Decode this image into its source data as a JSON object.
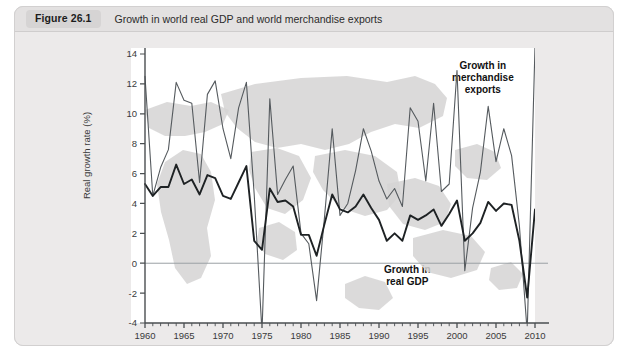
{
  "figure": {
    "badge": "Figure 26.1",
    "title": "Growth in world real GDP and world merchandise exports"
  },
  "colors": {
    "panel": "#ffffff",
    "card": "#eceaea",
    "caption_bar": "#e3e1e1",
    "badge": "#d6d4d4",
    "map": "#d5d4d3",
    "exports_line": "#555a5e",
    "gdp_line": "#1e2224",
    "zero_line": "#9aa0a4",
    "axis": "#4a4e51"
  },
  "annotations": {
    "exports": "Growth in\nmerchandise\nexports",
    "exports_lines": [
      "Growth in",
      "merchandise",
      "exports"
    ],
    "gdp": "Growth in\nreal GDP",
    "gdp_lines": [
      "Growth in",
      "real GDP"
    ]
  },
  "chart_data": {
    "type": "line",
    "title": "Growth in world real GDP and world merchandise exports",
    "xlabel": "",
    "ylabel": "Real growth rate (%)",
    "xlim": [
      1960,
      2010
    ],
    "ylim": [
      -4,
      14
    ],
    "ytick_step": 2,
    "yticks": [
      -4,
      -2,
      0,
      2,
      4,
      6,
      8,
      10,
      12,
      14
    ],
    "ytick_labels": [
      "-4",
      "-2",
      "0",
      "2",
      "4",
      "6",
      "8",
      "10",
      "12",
      "14"
    ],
    "xticks_major": [
      1960,
      1965,
      1970,
      1975,
      1980,
      1985,
      1990,
      1995,
      2000,
      2005,
      2010
    ],
    "xtick_labels": [
      "1960",
      "1965",
      "1970",
      "1975",
      "1980",
      "1985",
      "1990",
      "1995",
      "2000",
      "2005",
      "2010"
    ],
    "xticks_minor_step": 1,
    "grid": false,
    "zero_line": 0,
    "legend_position": "inline-annotation",
    "x": [
      1960,
      1961,
      1962,
      1963,
      1964,
      1965,
      1966,
      1967,
      1968,
      1969,
      1970,
      1971,
      1972,
      1973,
      1974,
      1975,
      1976,
      1977,
      1978,
      1979,
      1980,
      1981,
      1982,
      1983,
      1984,
      1985,
      1986,
      1987,
      1988,
      1989,
      1990,
      1991,
      1992,
      1993,
      1994,
      1995,
      1996,
      1997,
      1998,
      1999,
      2000,
      2001,
      2002,
      2003,
      2004,
      2005,
      2006,
      2007,
      2008,
      2009,
      2010
    ],
    "series": [
      {
        "name": "Growth in merchandise exports",
        "style": "thin",
        "values": [
          12.5,
          4.5,
          6.4,
          7.6,
          12.1,
          10.9,
          10.7,
          5.4,
          11.3,
          12.2,
          9.0,
          7.0,
          10.4,
          12.1,
          4.6,
          -7.0,
          11.0,
          4.6,
          5.6,
          6.5,
          2.0,
          1.3,
          -2.5,
          3.0,
          9.0,
          3.2,
          4.0,
          6.2,
          9.0,
          7.5,
          5.5,
          4.3,
          5.0,
          3.8,
          10.4,
          9.5,
          5.5,
          10.7,
          4.8,
          5.3,
          12.9,
          -0.5,
          3.7,
          6.1,
          10.5,
          6.8,
          9.0,
          7.2,
          2.5,
          -12.5,
          14.5
        ]
      },
      {
        "name": "Growth in real GDP",
        "style": "thick",
        "values": [
          5.3,
          4.5,
          5.1,
          5.1,
          6.6,
          5.3,
          5.6,
          4.6,
          5.9,
          5.7,
          4.5,
          4.3,
          5.4,
          6.5,
          1.5,
          0.9,
          5.0,
          4.1,
          4.2,
          3.8,
          1.9,
          1.9,
          0.5,
          2.6,
          4.6,
          3.6,
          3.4,
          3.8,
          4.6,
          3.7,
          2.9,
          1.5,
          2.0,
          1.5,
          3.2,
          2.9,
          3.2,
          3.6,
          2.5,
          3.3,
          4.2,
          1.5,
          2.0,
          2.7,
          4.1,
          3.5,
          4.0,
          3.9,
          1.5,
          -2.3,
          3.6
        ]
      }
    ]
  }
}
